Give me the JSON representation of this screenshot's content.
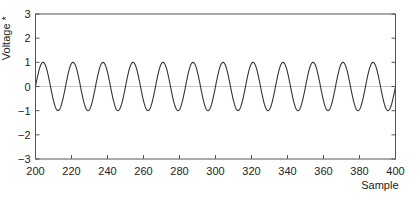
{
  "chart_data": {
    "type": "line",
    "title": "",
    "xlabel": "Sample",
    "ylabel": "Voltage *",
    "xlim": [
      200,
      400
    ],
    "ylim": [
      -3,
      3
    ],
    "xticks": [
      200,
      220,
      240,
      260,
      280,
      300,
      320,
      340,
      360,
      380,
      400
    ],
    "yticks": [
      3,
      2,
      1,
      0,
      -1,
      -2,
      -3
    ],
    "grid": false,
    "legend": null,
    "zero_line": true,
    "series": [
      {
        "name": "signal",
        "function": "sin(2*pi*0.06*(n-200))",
        "amplitude": 1.0,
        "frequency_cycles_per_sample": 0.06,
        "cycles_shown": 12,
        "x_start": 200,
        "x_end": 400,
        "peak": 1.0,
        "trough": -1.0
      }
    ]
  },
  "colors": {
    "signal": "#333333",
    "axis": "#555555",
    "zero_line": "#c8c8c8"
  },
  "layout": {
    "plot_left": 35.5,
    "plot_right": 395.5,
    "plot_top": 14,
    "plot_bottom": 159
  }
}
